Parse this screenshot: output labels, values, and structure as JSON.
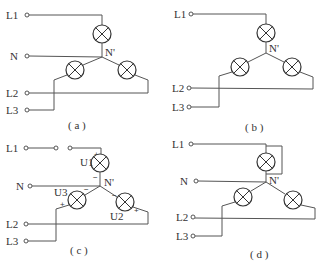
{
  "figure": {
    "panels": [
      {
        "id": "a",
        "caption": "( a )",
        "terminals": {
          "L1": "L1",
          "N": "N",
          "L2": "L2",
          "L3": "L3"
        },
        "neutral_point": "N'",
        "description": "Star-connected three lamps with neutral line N connected to N'"
      },
      {
        "id": "b",
        "caption": "( b )",
        "terminals": {
          "L1": "L1",
          "L2": "L2",
          "L3": "L3"
        },
        "neutral_point": "N'",
        "description": "Star-connected three lamps without neutral line"
      },
      {
        "id": "c",
        "caption": "( c )",
        "terminals": {
          "L1": "L1",
          "N": "N",
          "L2": "L2",
          "L3": "L3"
        },
        "neutral_point": "N'",
        "voltages": {
          "u1": "U1",
          "u2": "U2",
          "u3": "U3"
        },
        "plus": "+",
        "minus": "−",
        "description": "L1 line open via switch; voltage polarities marked on each lamp"
      },
      {
        "id": "d",
        "caption": "( d )",
        "terminals": {
          "L1": "L1",
          "N": "N",
          "L2": "L2",
          "L3": "L3"
        },
        "neutral_point": "N'",
        "description": "L1 lamp short-circuited by bypass wire"
      }
    ]
  }
}
